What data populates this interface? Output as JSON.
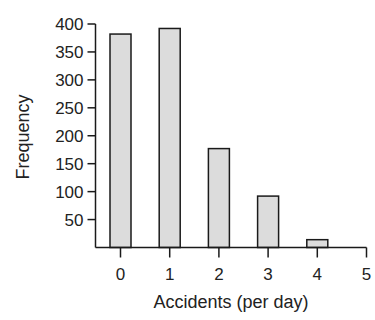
{
  "chart_data": {
    "type": "bar",
    "title": "",
    "xlabel": "Accidents (per day)",
    "ylabel": "Frequency",
    "categories": [
      "0",
      "1",
      "2",
      "3",
      "4"
    ],
    "values": [
      382,
      392,
      177,
      92,
      14
    ],
    "x_ticks": [
      "0",
      "1",
      "2",
      "3",
      "4",
      "5"
    ],
    "y_ticks": [
      50,
      100,
      150,
      200,
      250,
      300,
      350,
      400
    ],
    "ylim": [
      0,
      400
    ],
    "xlim": [
      0,
      5
    ],
    "grid": false,
    "legend": null,
    "colors": {
      "bar_fill": "#dcdcdc",
      "bar_stroke": "#1a1a1a",
      "axis": "#1a1a1a"
    }
  }
}
